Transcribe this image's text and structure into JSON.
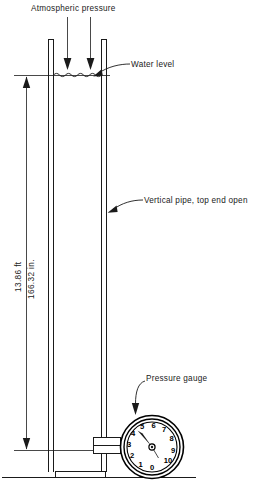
{
  "figure": {
    "labels": {
      "atmospheric_pressure": "Atmospheric pressure",
      "water_level": "Water level",
      "vertical_pipe": "Vertical pipe, top end open",
      "pressure_gauge": "Pressure gauge"
    },
    "dimension": {
      "value_ft": "13.86 ft",
      "value_in": "166.32 in."
    },
    "gauge": {
      "ticks": [
        "0",
        "1",
        "2",
        "3",
        "4",
        "5",
        "6",
        "7",
        "8",
        "9",
        "10"
      ],
      "needle_value": 4.7
    },
    "colors": {
      "ink": "#1a1a1a",
      "background": "#ffffff"
    }
  }
}
